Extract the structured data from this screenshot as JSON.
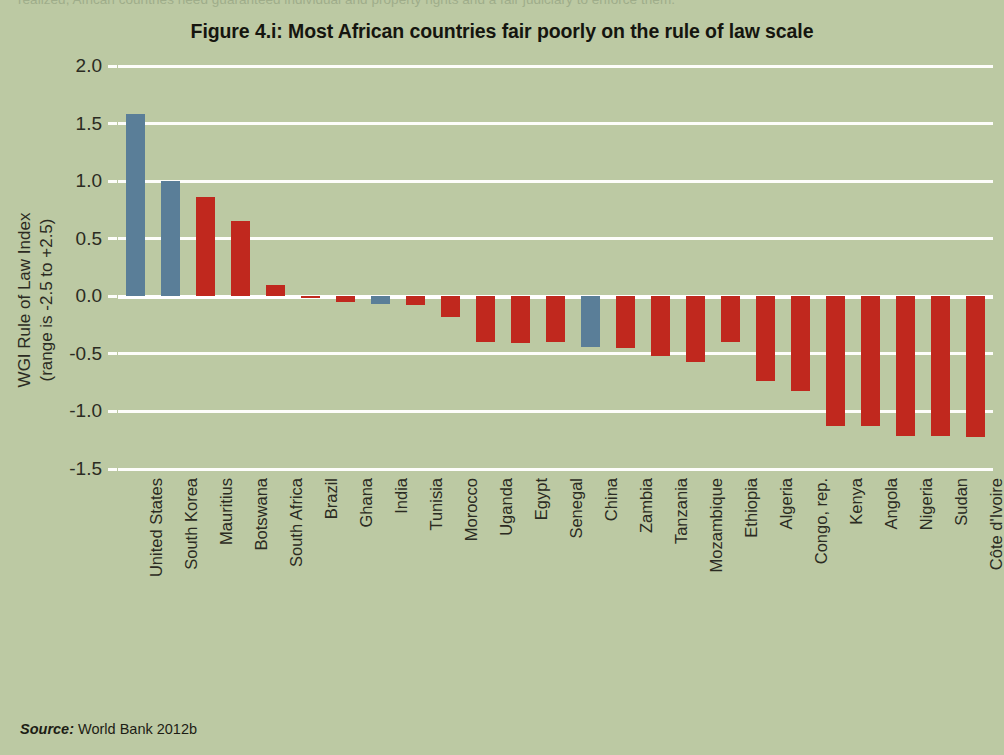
{
  "document": {
    "clipped_body_text": "realized, African countries need guaranteed individual and property rights and a fair judiciary to enforce them.",
    "source_prefix": "Source:",
    "source_text": " World Bank 2012b"
  },
  "colors": {
    "background": "#bcc9a3",
    "bar_red": "#c0281e",
    "bar_blue": "#5a7e98",
    "gridline": "#fdfdfa",
    "text": "#2b2b22"
  },
  "chart_data": {
    "type": "bar",
    "title": "Figure 4.i: Most African countries fair poorly on the rule of law scale",
    "xlabel": "",
    "ylabel": "WGI Rule of Law Index",
    "ylabel_line2": "(range is -2.5 to +2.5)",
    "ylim": [
      -1.5,
      2.0
    ],
    "yticks": [
      2.0,
      1.5,
      1.0,
      0.5,
      0.0,
      -0.5,
      -1.0,
      -1.5
    ],
    "ytick_labels": [
      "2.0",
      "1.5",
      "1.0",
      "0.5",
      "0.0",
      "-0.5",
      "-1.0",
      "-1.5"
    ],
    "grid": true,
    "legend": "none",
    "highlight_color_note": "blue bars mark non-African comparator countries",
    "categories": [
      "United States",
      "South Korea",
      "Mauritius",
      "Botswana",
      "South Africa",
      "Brazil",
      "Ghana",
      "India",
      "Tunisia",
      "Morocco",
      "Uganda",
      "Egypt",
      "Senegal",
      "China",
      "Zambia",
      "Tanzania",
      "Mozambique",
      "Ethiopia",
      "Algeria",
      "Congo, rep.",
      "Kenya",
      "Angola",
      "Nigeria",
      "Sudan",
      "Côte d'Ivoire"
    ],
    "values": [
      1.58,
      1.0,
      0.86,
      0.65,
      0.1,
      -0.01,
      -0.05,
      -0.07,
      -0.08,
      -0.18,
      -0.4,
      -0.41,
      -0.4,
      -0.44,
      -0.45,
      -0.52,
      -0.57,
      -0.4,
      -0.74,
      -0.82,
      -1.13,
      -1.13,
      -1.21,
      -1.21,
      -1.22
    ],
    "series_colors": [
      "blue",
      "blue",
      "red",
      "red",
      "red",
      "red",
      "red",
      "blue",
      "red",
      "red",
      "red",
      "red",
      "red",
      "blue",
      "red",
      "red",
      "red",
      "red",
      "red",
      "red",
      "red",
      "red",
      "red",
      "red",
      "red"
    ]
  }
}
